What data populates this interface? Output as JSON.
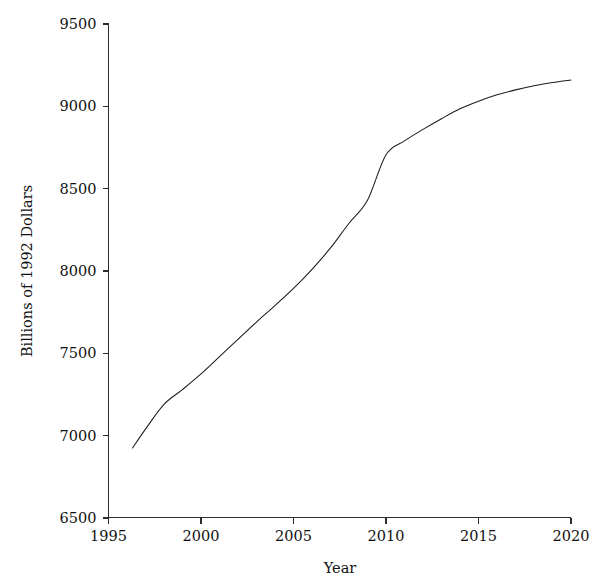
{
  "chart_data": {
    "type": "line",
    "title": "",
    "subtitle": "",
    "xlabel": "Year",
    "ylabel": "Billions of 1992 Dollars",
    "xlim": [
      1995,
      2020
    ],
    "ylim": [
      6500,
      9500
    ],
    "xticks": [
      1995,
      2000,
      2005,
      2010,
      2015,
      2020
    ],
    "xtick_labels": [
      "1995",
      "2000",
      "2005",
      "2010",
      "2015",
      "2020"
    ],
    "yticks": [
      6500,
      7000,
      7500,
      8000,
      8500,
      9000,
      9500
    ],
    "ytick_labels": [
      "6500",
      "7000",
      "7500",
      "8000",
      "8500",
      "9000",
      "9500"
    ],
    "grid": false,
    "legend": null,
    "legend_position": "none",
    "line_color": "#1c1c1c",
    "axis_color": "#2b2b2b",
    "background_color": "#ffffff",
    "annotations": [],
    "series": [
      {
        "name": "Real GDP",
        "x": [
          1996.3,
          1997,
          1998,
          1999,
          2000,
          2001,
          2002,
          2003,
          2004,
          2005,
          2006,
          2007,
          2008,
          2009,
          2010,
          2011,
          2012,
          2013,
          2014,
          2015,
          2016,
          2017,
          2018,
          2019,
          2020
        ],
        "values": [
          6925,
          7040,
          7190,
          7280,
          7375,
          7480,
          7585,
          7690,
          7790,
          7894,
          8010,
          8140,
          8290,
          8430,
          8706,
          8790,
          8860,
          8925,
          8985,
          9031,
          9070,
          9100,
          9125,
          9145,
          9160
        ]
      }
    ]
  }
}
